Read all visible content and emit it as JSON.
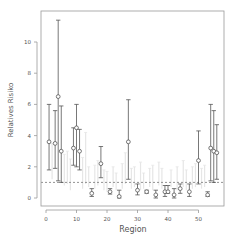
{
  "chart_data": {
    "type": "scatter",
    "title": "",
    "xlabel": "Region",
    "ylabel": "Relatives Risiko",
    "xlim": [
      -3,
      58
    ],
    "ylim": [
      -0.5,
      12
    ],
    "x_ticks": [
      0,
      10,
      20,
      30,
      40,
      50
    ],
    "y_ticks": [
      0,
      2,
      4,
      6,
      8,
      10
    ],
    "reference_line": {
      "y": 1,
      "style": "dotted"
    },
    "grid": false,
    "legend": null,
    "series": [
      {
        "name": "significant regions (point estimate with interval)",
        "color": "#555555",
        "points": [
          {
            "x": 1,
            "y": 3.6,
            "low": 1.8,
            "high": 6.0
          },
          {
            "x": 3,
            "y": 3.5,
            "low": 1.9,
            "high": 5.6
          },
          {
            "x": 4,
            "y": 6.5,
            "low": 1.1,
            "high": 11.4
          },
          {
            "x": 5,
            "y": 3.0,
            "low": 1.0,
            "high": 5.9
          },
          {
            "x": 9,
            "y": 3.2,
            "low": 2.1,
            "high": 4.5
          },
          {
            "x": 10,
            "y": 4.5,
            "low": 2.0,
            "high": 6.0
          },
          {
            "x": 11,
            "y": 3.0,
            "low": 1.8,
            "high": 4.4
          },
          {
            "x": 15,
            "y": 0.3,
            "low": 0.1,
            "high": 0.6
          },
          {
            "x": 18,
            "y": 2.2,
            "low": 1.3,
            "high": 3.3
          },
          {
            "x": 21,
            "y": 0.4,
            "low": 0.25,
            "high": 0.6
          },
          {
            "x": 24,
            "y": 0.1,
            "low": 0.0,
            "high": 0.5
          },
          {
            "x": 27,
            "y": 3.6,
            "low": 1.2,
            "high": 6.3
          },
          {
            "x": 30,
            "y": 0.5,
            "low": 0.2,
            "high": 0.9
          },
          {
            "x": 33,
            "y": 0.4,
            "low": 0.3,
            "high": 0.5
          },
          {
            "x": 36,
            "y": 0.2,
            "low": 0.0,
            "high": 0.5
          },
          {
            "x": 39,
            "y": 0.4,
            "low": 0.1,
            "high": 0.8
          },
          {
            "x": 40,
            "y": 0.4,
            "low": 0.3,
            "high": 0.8
          },
          {
            "x": 42,
            "y": 0.2,
            "low": 0.0,
            "high": 0.6
          },
          {
            "x": 44,
            "y": 0.6,
            "low": 0.3,
            "high": 0.9
          },
          {
            "x": 47,
            "y": 0.4,
            "low": 0.1,
            "high": 0.9
          },
          {
            "x": 50,
            "y": 2.4,
            "low": 0.9,
            "high": 4.3
          },
          {
            "x": 53,
            "y": 0.2,
            "low": 0.1,
            "high": 0.4
          },
          {
            "x": 54,
            "y": 3.2,
            "low": 1.1,
            "high": 6.0
          },
          {
            "x": 55,
            "y": 3.0,
            "low": 1.0,
            "high": 5.6
          },
          {
            "x": 56,
            "y": 2.9,
            "low": 1.2,
            "high": 4.7
          }
        ]
      },
      {
        "name": "non-significant regions (faint intervals)",
        "color": "#e6e6e6",
        "intervals": [
          {
            "x": 2,
            "low": 1.2,
            "high": 3.5
          },
          {
            "x": 6,
            "low": 0.8,
            "high": 2.8
          },
          {
            "x": 7,
            "low": 0.9,
            "high": 3.0
          },
          {
            "x": 8,
            "low": 0.5,
            "high": 2.5
          },
          {
            "x": 12,
            "low": 0.6,
            "high": 2.6
          },
          {
            "x": 13,
            "low": 0.9,
            "high": 4.2
          },
          {
            "x": 14,
            "low": 0.7,
            "high": 2.0
          },
          {
            "x": 16,
            "low": 0.6,
            "high": 2.1
          },
          {
            "x": 17,
            "low": 0.8,
            "high": 2.4
          },
          {
            "x": 19,
            "low": 0.5,
            "high": 1.8
          },
          {
            "x": 20,
            "low": 0.4,
            "high": 1.7
          },
          {
            "x": 22,
            "low": 0.7,
            "high": 2.0
          },
          {
            "x": 23,
            "low": 0.5,
            "high": 1.6
          },
          {
            "x": 25,
            "low": 0.6,
            "high": 2.2
          },
          {
            "x": 26,
            "low": 0.9,
            "high": 2.9
          },
          {
            "x": 28,
            "low": 0.6,
            "high": 1.9
          },
          {
            "x": 29,
            "low": 0.7,
            "high": 2.0
          },
          {
            "x": 31,
            "low": 0.5,
            "high": 2.3
          },
          {
            "x": 32,
            "low": 0.6,
            "high": 1.6
          },
          {
            "x": 34,
            "low": 0.7,
            "high": 1.9
          },
          {
            "x": 35,
            "low": 0.5,
            "high": 2.1
          },
          {
            "x": 37,
            "low": 0.8,
            "high": 2.3
          },
          {
            "x": 38,
            "low": 0.6,
            "high": 1.9
          },
          {
            "x": 41,
            "low": 0.7,
            "high": 1.8
          },
          {
            "x": 43,
            "low": 0.5,
            "high": 2.0
          },
          {
            "x": 45,
            "low": 0.7,
            "high": 2.4
          },
          {
            "x": 46,
            "low": 0.5,
            "high": 1.8
          },
          {
            "x": 48,
            "low": 0.6,
            "high": 2.0
          },
          {
            "x": 49,
            "low": 0.7,
            "high": 2.2
          },
          {
            "x": 51,
            "low": 0.6,
            "high": 1.9
          },
          {
            "x": 52,
            "low": 0.7,
            "high": 2.1
          }
        ]
      }
    ]
  }
}
